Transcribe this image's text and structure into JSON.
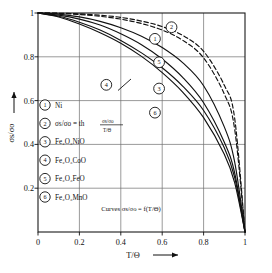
{
  "chart_data": {
    "type": "line",
    "title": "",
    "xlabel": "T/Θ",
    "ylabel": "σs/σo",
    "xlim": [
      0,
      1
    ],
    "ylim": [
      0,
      1
    ],
    "xticks": [
      "0",
      "0.2",
      "0.4",
      "0.6",
      "0.8",
      "1"
    ],
    "yticks": [
      "0.2",
      "0.4",
      "0.6",
      "0.8",
      "1"
    ],
    "grid": true,
    "legend_position": "inside-lower-left",
    "annotation": "Curves σs/σo = f(T/Θ)",
    "x": [
      0,
      0.1,
      0.2,
      0.3,
      0.4,
      0.5,
      0.6,
      0.7,
      0.8,
      0.9,
      0.95,
      1.0
    ],
    "series": [
      {
        "name": "1",
        "label": "Ni",
        "style": "dashed",
        "values": [
          1.0,
          0.998,
          0.993,
          0.985,
          0.972,
          0.952,
          0.922,
          0.875,
          0.795,
          0.63,
          0.47,
          0.0
        ]
      },
      {
        "name": "2",
        "label": "σs/σo = th (σs/σo)/(T/Θ)",
        "style": "dashed",
        "values": [
          1.0,
          0.999,
          0.996,
          0.99,
          0.98,
          0.963,
          0.938,
          0.897,
          0.825,
          0.67,
          0.52,
          0.0
        ]
      },
      {
        "name": "3",
        "label": "Fe₂O₃NiO",
        "style": "solid",
        "values": [
          1.0,
          0.99,
          0.972,
          0.945,
          0.905,
          0.855,
          0.79,
          0.705,
          0.59,
          0.41,
          0.27,
          0.0
        ]
      },
      {
        "name": "4",
        "label": "Fe₂O₃CoO",
        "style": "solid",
        "values": [
          1.0,
          0.985,
          0.958,
          0.922,
          0.875,
          0.818,
          0.75,
          0.665,
          0.555,
          0.385,
          0.25,
          0.0
        ]
      },
      {
        "name": "5",
        "label": "Fe₂O₃FeO",
        "style": "solid",
        "values": [
          1.0,
          0.995,
          0.982,
          0.962,
          0.933,
          0.894,
          0.842,
          0.772,
          0.668,
          0.48,
          0.32,
          0.0
        ]
      },
      {
        "name": "6",
        "label": "Fe₂O₃MnO",
        "style": "solid",
        "values": [
          1.0,
          0.982,
          0.95,
          0.91,
          0.862,
          0.802,
          0.728,
          0.638,
          0.522,
          0.355,
          0.225,
          0.0
        ]
      }
    ],
    "curve_markers": [
      {
        "id": "2",
        "x": 0.645,
        "y": 0.935
      },
      {
        "id": "1",
        "x": 0.565,
        "y": 0.882
      },
      {
        "id": "5",
        "x": 0.585,
        "y": 0.775
      },
      {
        "id": "4",
        "x": 0.33,
        "y": 0.672
      },
      {
        "id": "3",
        "x": 0.585,
        "y": 0.655
      },
      {
        "id": "6",
        "x": 0.565,
        "y": 0.545
      }
    ]
  },
  "legend": {
    "items": [
      {
        "num": "1",
        "text": "Ni"
      },
      {
        "num": "2",
        "text": "σs/σo  = th"
      },
      {
        "num": "3",
        "text": "Fe₂O₃NiO"
      },
      {
        "num": "4",
        "text": "Fe₂O₃CoO"
      },
      {
        "num": "5",
        "text": "Fe₂O₃FeO"
      },
      {
        "num": "6",
        "text": "Fe₂O₃MnO"
      }
    ],
    "fraction_numerator": "σs/σo",
    "fraction_denominator": "T/Θ"
  },
  "axes": {
    "x_tick_0": "0",
    "x_tick_1": "0.2",
    "x_tick_2": "0.4",
    "x_tick_3": "0.6",
    "x_tick_4": "0.8",
    "x_tick_5": "1",
    "y_tick_1": "0.2",
    "y_tick_2": "0.4",
    "y_tick_3": "0.6",
    "y_tick_4": "0.8",
    "y_tick_5": "1",
    "x_axis_title": "T/Θ",
    "y_axis_title": "σs/σo"
  },
  "caption": {
    "text": "Curves σs/σo = f(T/Θ)"
  }
}
